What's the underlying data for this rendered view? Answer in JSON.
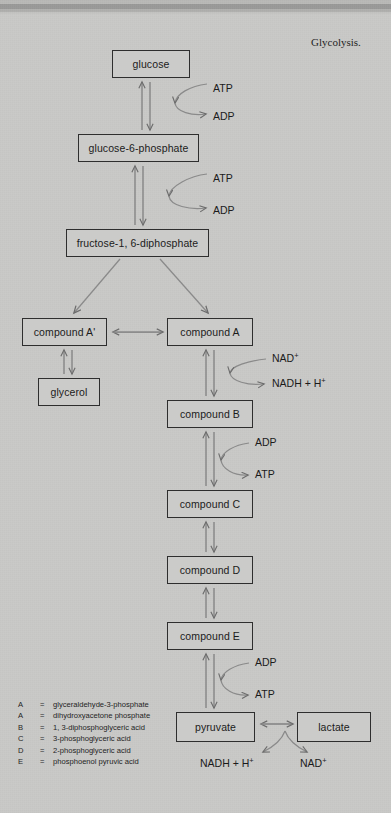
{
  "document": {
    "title": "Glycolysis.",
    "background_color": "#c9c9c7",
    "ink_color": "#2e2e2e"
  },
  "diagram": {
    "type": "flowchart",
    "nodes": [
      {
        "id": "glucose",
        "label": "glucose",
        "x": 112,
        "y": 50,
        "w": 78,
        "h": 28
      },
      {
        "id": "g6p",
        "label": "glucose-6-phosphate",
        "x": 78,
        "y": 134,
        "w": 121,
        "h": 28
      },
      {
        "id": "fdp",
        "label": "fructose-1, 6-diphosphate",
        "x": 66,
        "y": 229,
        "w": 143,
        "h": 28
      },
      {
        "id": "compA_p",
        "label": "compound A'",
        "x": 22,
        "y": 318,
        "w": 85,
        "h": 28
      },
      {
        "id": "compA",
        "label": "compound A",
        "x": 167,
        "y": 318,
        "w": 86,
        "h": 28
      },
      {
        "id": "glycerol",
        "label": "glycerol",
        "x": 38,
        "y": 378,
        "w": 62,
        "h": 28
      },
      {
        "id": "compB",
        "label": "compound B",
        "x": 167,
        "y": 400,
        "w": 86,
        "h": 28
      },
      {
        "id": "compC",
        "label": "compound C",
        "x": 167,
        "y": 490,
        "w": 86,
        "h": 28
      },
      {
        "id": "compD",
        "label": "compound D",
        "x": 167,
        "y": 556,
        "w": 86,
        "h": 28
      },
      {
        "id": "compE",
        "label": "compound E",
        "x": 167,
        "y": 622,
        "w": 86,
        "h": 28
      },
      {
        "id": "pyruvate",
        "label": "pyruvate",
        "x": 176,
        "y": 712,
        "w": 79,
        "h": 30
      },
      {
        "id": "lactate",
        "label": "lactate",
        "x": 297,
        "y": 712,
        "w": 74,
        "h": 30
      }
    ],
    "cofactors": [
      {
        "id": "atp1",
        "label": "ATP",
        "sup": "",
        "x": 213,
        "y": 82,
        "reaction": "glucose-to-g6p"
      },
      {
        "id": "adp1",
        "label": "ADP",
        "sup": "",
        "x": 213,
        "y": 110,
        "reaction": "glucose-to-g6p"
      },
      {
        "id": "atp2",
        "label": "ATP",
        "sup": "",
        "x": 213,
        "y": 172,
        "reaction": "g6p-to-fdp"
      },
      {
        "id": "adp2",
        "label": "ADP",
        "sup": "",
        "x": 213,
        "y": 204,
        "reaction": "g6p-to-fdp"
      },
      {
        "id": "nad1",
        "label": "NAD",
        "sup": "+",
        "x": 272,
        "y": 357,
        "reaction": "compA-to-compB"
      },
      {
        "id": "nadh1",
        "label": "NADH + H",
        "sup": "+",
        "x": 272,
        "y": 382,
        "reaction": "compA-to-compB"
      },
      {
        "id": "adp3",
        "label": "ADP",
        "sup": "",
        "x": 255,
        "y": 441,
        "reaction": "compB-to-compC"
      },
      {
        "id": "atp3",
        "label": "ATP",
        "sup": "",
        "x": 255,
        "y": 473,
        "reaction": "compB-to-compC"
      },
      {
        "id": "adp4",
        "label": "ADP",
        "sup": "",
        "x": 255,
        "y": 661,
        "reaction": "compE-to-pyruvate"
      },
      {
        "id": "atp4",
        "label": "ATP",
        "sup": "",
        "x": 255,
        "y": 693,
        "reaction": "compE-to-pyruvate"
      },
      {
        "id": "nadh2",
        "label": "NADH + H",
        "sup": "+",
        "x": 200,
        "y": 759,
        "reaction": "pyruvate-lactate"
      },
      {
        "id": "nad2",
        "label": "NAD",
        "sup": "+",
        "x": 297,
        "y": 759,
        "reaction": "pyruvate-lactate"
      }
    ]
  },
  "legend": {
    "rows": [
      {
        "key": "A",
        "eq": "=",
        "value": "glyceraldehyde-3-phosphate"
      },
      {
        "key": "A",
        "eq": "=",
        "value": "dihydroxyacetone phosphate"
      },
      {
        "key": "B",
        "eq": "=",
        "value": "1, 3-diphosphoglyceric acid"
      },
      {
        "key": "C",
        "eq": "=",
        "value": "3-phosphoglyceric acid"
      },
      {
        "key": "D",
        "eq": "=",
        "value": "2-phosphoglyceric acid"
      },
      {
        "key": "E",
        "eq": "=",
        "value": "phosphoenol pyruvic acid"
      }
    ]
  }
}
